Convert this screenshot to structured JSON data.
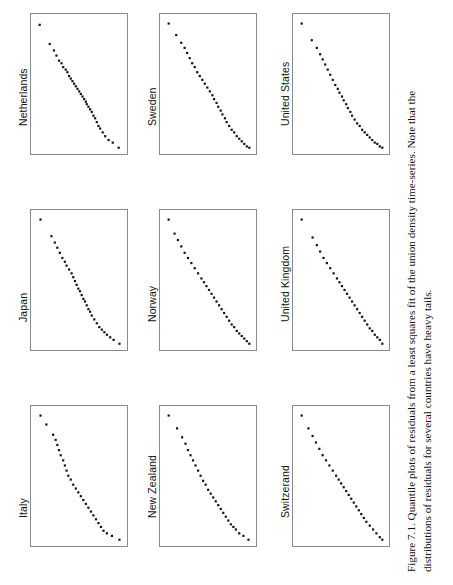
{
  "figure": {
    "caption_number": "Figure 7.1.",
    "caption_line1": "Figure 7.1. Quantile plots of residuals from a least squares fit of the union density time-series. Note that the",
    "caption_line2": "distributions of residuals for several countries have heavy tails.",
    "caption_full": "Figure 7.1. Quantile plots of residuals from a least squares fit of the union density time-series. Note that the distributions of residuals for several countries have heavy tails.",
    "orientation": "rotated-90",
    "background_color": "#ffffff",
    "point_color": "#141414",
    "frame_color": "#8a8a8a"
  },
  "chart_data": {
    "type": "scatter",
    "title": "Quantile plots of residuals from a least squares fit of the union density time-series",
    "xlabel": "",
    "ylabel": "",
    "grid": false,
    "legend": "none",
    "layout": {
      "rows": 3,
      "cols": 3,
      "panel_width": 98,
      "panel_height": 142
    },
    "panels": [
      {
        "label": "Netherlands",
        "col": 0,
        "row": 0,
        "x": [
          0.02,
          0.14,
          0.19,
          0.22,
          0.25,
          0.28,
          0.3,
          0.33,
          0.35,
          0.37,
          0.39,
          0.41,
          0.43,
          0.45,
          0.47,
          0.49,
          0.51,
          0.53,
          0.55,
          0.57,
          0.58,
          0.6,
          0.62,
          0.64,
          0.66,
          0.68,
          0.7,
          0.72,
          0.74,
          0.77,
          0.8,
          0.84,
          0.89,
          0.96
        ],
        "y": [
          0.03,
          0.18,
          0.23,
          0.27,
          0.31,
          0.33,
          0.36,
          0.38,
          0.4,
          0.43,
          0.45,
          0.47,
          0.49,
          0.51,
          0.53,
          0.55,
          0.57,
          0.59,
          0.61,
          0.63,
          0.65,
          0.67,
          0.69,
          0.71,
          0.74,
          0.76,
          0.79,
          0.82,
          0.84,
          0.87,
          0.9,
          0.93,
          0.95,
          0.99
        ]
      },
      {
        "label": "Japan",
        "col": 0,
        "row": 1,
        "x": [
          0.03,
          0.16,
          0.2,
          0.23,
          0.26,
          0.29,
          0.32,
          0.34,
          0.37,
          0.4,
          0.42,
          0.44,
          0.46,
          0.48,
          0.5,
          0.52,
          0.54,
          0.56,
          0.58,
          0.6,
          0.62,
          0.64,
          0.67,
          0.7,
          0.73,
          0.76,
          0.79,
          0.82,
          0.86,
          0.9,
          0.97
        ],
        "y": [
          0.02,
          0.15,
          0.2,
          0.24,
          0.28,
          0.32,
          0.35,
          0.38,
          0.41,
          0.44,
          0.47,
          0.5,
          0.53,
          0.56,
          0.58,
          0.61,
          0.64,
          0.66,
          0.69,
          0.72,
          0.74,
          0.77,
          0.8,
          0.83,
          0.86,
          0.88,
          0.9,
          0.92,
          0.94,
          0.96,
          0.99
        ]
      },
      {
        "label": "Italy",
        "col": 0,
        "row": 2,
        "x": [
          0.03,
          0.1,
          0.18,
          0.21,
          0.23,
          0.25,
          0.27,
          0.3,
          0.32,
          0.34,
          0.36,
          0.39,
          0.42,
          0.45,
          0.48,
          0.51,
          0.54,
          0.57,
          0.6,
          0.63,
          0.66,
          0.69,
          0.72,
          0.75,
          0.78,
          0.82,
          0.88,
          0.97
        ],
        "y": [
          0.02,
          0.09,
          0.17,
          0.21,
          0.25,
          0.29,
          0.33,
          0.37,
          0.41,
          0.45,
          0.49,
          0.52,
          0.56,
          0.59,
          0.62,
          0.65,
          0.68,
          0.71,
          0.74,
          0.77,
          0.8,
          0.83,
          0.86,
          0.89,
          0.92,
          0.94,
          0.96,
          0.99
        ]
      },
      {
        "label": "Sweden",
        "col": 1,
        "row": 0,
        "x": [
          0.02,
          0.11,
          0.17,
          0.21,
          0.24,
          0.27,
          0.3,
          0.33,
          0.36,
          0.39,
          0.42,
          0.45,
          0.48,
          0.51,
          0.54,
          0.56,
          0.59,
          0.61,
          0.64,
          0.66,
          0.69,
          0.71,
          0.74,
          0.77,
          0.8,
          0.83,
          0.86,
          0.89,
          0.92,
          0.95,
          0.98
        ],
        "y": [
          0.02,
          0.11,
          0.17,
          0.21,
          0.25,
          0.29,
          0.33,
          0.36,
          0.4,
          0.43,
          0.46,
          0.49,
          0.52,
          0.55,
          0.58,
          0.61,
          0.64,
          0.67,
          0.7,
          0.73,
          0.76,
          0.79,
          0.82,
          0.85,
          0.87,
          0.9,
          0.92,
          0.94,
          0.96,
          0.98,
          0.99
        ]
      },
      {
        "label": "Norway",
        "col": 1,
        "row": 1,
        "x": [
          0.02,
          0.09,
          0.13,
          0.17,
          0.21,
          0.25,
          0.29,
          0.33,
          0.37,
          0.41,
          0.44,
          0.47,
          0.5,
          0.53,
          0.56,
          0.59,
          0.62,
          0.65,
          0.68,
          0.71,
          0.74,
          0.77,
          0.8,
          0.83,
          0.86,
          0.89,
          0.92,
          0.95,
          0.98
        ],
        "y": [
          0.02,
          0.13,
          0.18,
          0.23,
          0.28,
          0.32,
          0.36,
          0.4,
          0.44,
          0.48,
          0.51,
          0.54,
          0.57,
          0.6,
          0.63,
          0.66,
          0.69,
          0.72,
          0.75,
          0.78,
          0.81,
          0.84,
          0.86,
          0.89,
          0.91,
          0.93,
          0.95,
          0.97,
          0.99
        ]
      },
      {
        "label": "New Zealand",
        "col": 1,
        "row": 2,
        "x": [
          0.02,
          0.12,
          0.18,
          0.22,
          0.25,
          0.28,
          0.31,
          0.34,
          0.37,
          0.4,
          0.43,
          0.46,
          0.49,
          0.52,
          0.55,
          0.58,
          0.61,
          0.64,
          0.67,
          0.7,
          0.73,
          0.76,
          0.79,
          0.82,
          0.86,
          0.91,
          0.97
        ],
        "y": [
          0.02,
          0.12,
          0.19,
          0.24,
          0.29,
          0.33,
          0.37,
          0.41,
          0.45,
          0.49,
          0.53,
          0.56,
          0.6,
          0.63,
          0.66,
          0.69,
          0.72,
          0.75,
          0.78,
          0.81,
          0.84,
          0.87,
          0.89,
          0.91,
          0.94,
          0.96,
          0.99
        ]
      },
      {
        "label": "United States",
        "col": 2,
        "row": 0,
        "x": [
          0.02,
          0.14,
          0.2,
          0.24,
          0.27,
          0.3,
          0.33,
          0.36,
          0.39,
          0.42,
          0.45,
          0.47,
          0.5,
          0.52,
          0.55,
          0.57,
          0.6,
          0.62,
          0.65,
          0.68,
          0.71,
          0.74,
          0.77,
          0.8,
          0.83,
          0.86,
          0.89,
          0.92,
          0.95,
          0.98
        ],
        "y": [
          0.02,
          0.15,
          0.21,
          0.26,
          0.3,
          0.34,
          0.38,
          0.42,
          0.46,
          0.5,
          0.53,
          0.56,
          0.59,
          0.62,
          0.65,
          0.68,
          0.71,
          0.74,
          0.77,
          0.8,
          0.82,
          0.85,
          0.87,
          0.89,
          0.91,
          0.93,
          0.95,
          0.96,
          0.98,
          0.99
        ]
      },
      {
        "label": "United Kingdom",
        "col": 2,
        "row": 1,
        "x": [
          0.02,
          0.15,
          0.2,
          0.24,
          0.28,
          0.32,
          0.36,
          0.4,
          0.44,
          0.47,
          0.5,
          0.53,
          0.56,
          0.59,
          0.62,
          0.65,
          0.68,
          0.71,
          0.74,
          0.77,
          0.8,
          0.83,
          0.86,
          0.89,
          0.92,
          0.95,
          0.98
        ],
        "y": [
          0.02,
          0.16,
          0.22,
          0.27,
          0.32,
          0.36,
          0.4,
          0.44,
          0.48,
          0.51,
          0.54,
          0.57,
          0.6,
          0.63,
          0.66,
          0.69,
          0.72,
          0.75,
          0.78,
          0.81,
          0.84,
          0.87,
          0.89,
          0.92,
          0.94,
          0.96,
          0.99
        ]
      },
      {
        "label": "Switzerand",
        "col": 2,
        "row": 2,
        "x": [
          0.02,
          0.1,
          0.15,
          0.19,
          0.23,
          0.27,
          0.31,
          0.35,
          0.39,
          0.43,
          0.46,
          0.49,
          0.52,
          0.55,
          0.58,
          0.61,
          0.64,
          0.67,
          0.7,
          0.73,
          0.76,
          0.79,
          0.83,
          0.87,
          0.91,
          0.95,
          0.98
        ],
        "y": [
          0.02,
          0.12,
          0.18,
          0.23,
          0.28,
          0.33,
          0.37,
          0.41,
          0.45,
          0.49,
          0.52,
          0.55,
          0.58,
          0.61,
          0.64,
          0.67,
          0.7,
          0.73,
          0.76,
          0.79,
          0.82,
          0.85,
          0.88,
          0.91,
          0.94,
          0.97,
          0.99
        ]
      }
    ]
  }
}
